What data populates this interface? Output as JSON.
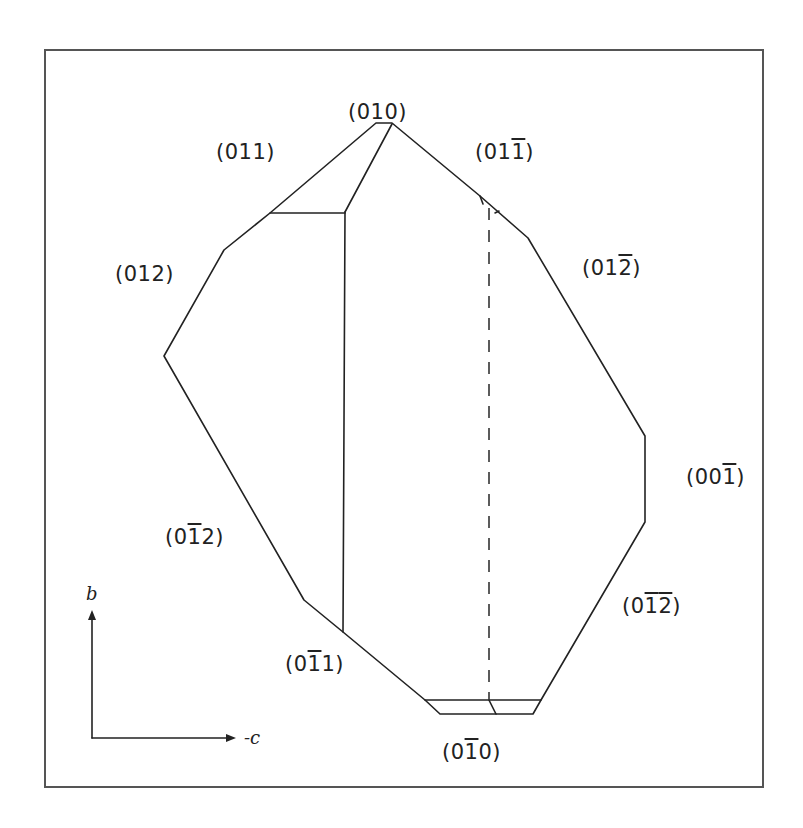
{
  "figure": {
    "type": "crystal habit drawing",
    "faces": [
      {
        "id": "010",
        "digits": [
          {
            "d": "0",
            "bar": false
          },
          {
            "d": "1",
            "bar": false
          },
          {
            "d": "0",
            "bar": false
          }
        ]
      },
      {
        "id": "011",
        "digits": [
          {
            "d": "0",
            "bar": false
          },
          {
            "d": "1",
            "bar": false
          },
          {
            "d": "1",
            "bar": false
          }
        ]
      },
      {
        "id": "01-1",
        "digits": [
          {
            "d": "0",
            "bar": false
          },
          {
            "d": "1",
            "bar": false
          },
          {
            "d": "1",
            "bar": true
          }
        ]
      },
      {
        "id": "012",
        "digits": [
          {
            "d": "0",
            "bar": false
          },
          {
            "d": "1",
            "bar": false
          },
          {
            "d": "2",
            "bar": false
          }
        ]
      },
      {
        "id": "01-2",
        "digits": [
          {
            "d": "0",
            "bar": false
          },
          {
            "d": "1",
            "bar": false
          },
          {
            "d": "2",
            "bar": true
          }
        ]
      },
      {
        "id": "00-1",
        "digits": [
          {
            "d": "0",
            "bar": false
          },
          {
            "d": "0",
            "bar": false
          },
          {
            "d": "1",
            "bar": true
          }
        ]
      },
      {
        "id": "0-12",
        "digits": [
          {
            "d": "0",
            "bar": false
          },
          {
            "d": "1",
            "bar": true
          },
          {
            "d": "2",
            "bar": false
          }
        ]
      },
      {
        "id": "0-1-2",
        "digits": [
          {
            "d": "0",
            "bar": false
          },
          {
            "d": "1",
            "bar": true
          },
          {
            "d": "2",
            "bar": true
          }
        ]
      },
      {
        "id": "0-11",
        "digits": [
          {
            "d": "0",
            "bar": false
          },
          {
            "d": "1",
            "bar": true
          },
          {
            "d": "1",
            "bar": false
          }
        ]
      },
      {
        "id": "0-10",
        "digits": [
          {
            "d": "0",
            "bar": false
          },
          {
            "d": "1",
            "bar": true
          },
          {
            "d": "0",
            "bar": false
          }
        ]
      }
    ],
    "axes": {
      "vertical_label": "b",
      "horizontal_label": "-c"
    }
  }
}
